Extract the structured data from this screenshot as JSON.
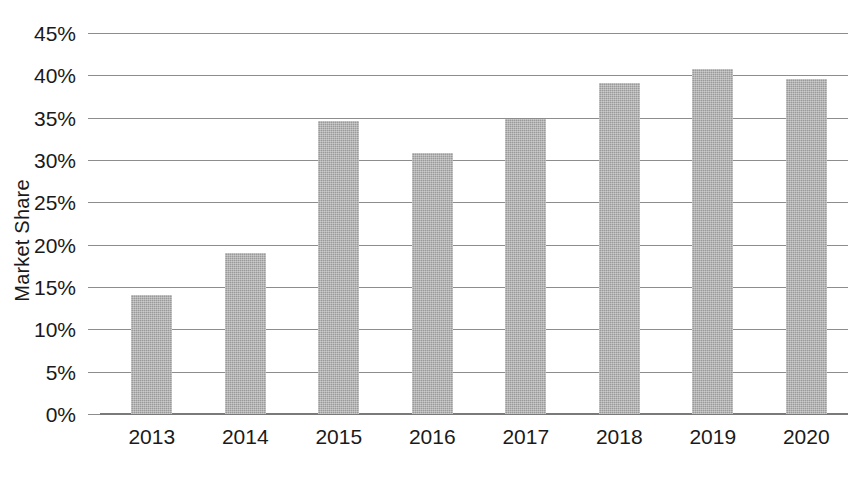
{
  "chart_data": {
    "type": "bar",
    "title": "",
    "subtitle": "",
    "xlabel": "",
    "ylabel": "Market Share",
    "categories": [
      "2013",
      "2014",
      "2015",
      "2016",
      "2017",
      "2018",
      "2019",
      "2020"
    ],
    "values": [
      14.0,
      19.0,
      34.6,
      30.8,
      34.8,
      39.1,
      40.8,
      39.6
    ],
    "value_format": "percent",
    "ylim": [
      0,
      45
    ],
    "ytick_values": [
      0,
      5,
      10,
      15,
      20,
      25,
      30,
      35,
      40,
      45
    ],
    "ytick_labels": [
      "0%",
      "5%",
      "10%",
      "15%",
      "20%",
      "25%",
      "30%",
      "35%",
      "40%",
      "45%"
    ],
    "xtick_labels": [
      "2013",
      "2014",
      "2015",
      "2016",
      "2017",
      "2018",
      "2019",
      "2020"
    ],
    "grid": true,
    "grid_axis": "y",
    "legend": false,
    "legend_position": "none",
    "series": [
      {
        "name": "Market Share",
        "values": [
          14.0,
          19.0,
          34.6,
          30.8,
          34.8,
          39.1,
          40.8,
          39.6
        ]
      }
    ],
    "annotations": []
  },
  "style": {
    "background": "#ffffff",
    "bar_fill": "#9a9a9a",
    "grid_color": "#8d8d8d",
    "axis_color": "#7a7a7a",
    "text_color": "#1a1a1a"
  }
}
